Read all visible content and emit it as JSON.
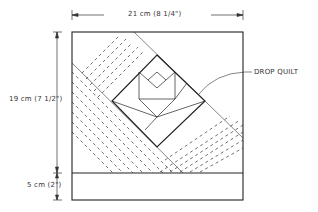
{
  "diagram": {
    "type": "technical-drawing",
    "dimensions": {
      "width_label": "21 cm (8 1/4\")",
      "height_label": "19 cm (7 1/2\")",
      "drop_label": "5 cm (2\")"
    },
    "callouts": {
      "drop_quilt": "DROP QUILT"
    },
    "colors": {
      "line": "#222222",
      "background": "#ffffff"
    }
  }
}
